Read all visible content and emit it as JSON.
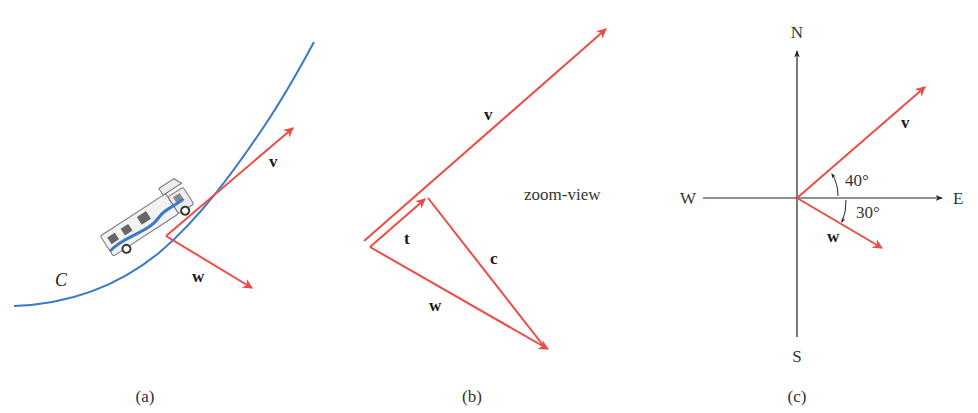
{
  "figure": {
    "colors": {
      "vector": "#ef4b45",
      "curve": "#3b78c9",
      "axis": "#222222",
      "text": "#222222"
    },
    "panel_a": {
      "caption": "(a)",
      "curve_label": "C",
      "vector_v_label": "v",
      "vector_w_label": "w",
      "vehicle": "motorhome-on-curve"
    },
    "panel_b": {
      "caption": "(b)",
      "title": "zoom-view",
      "vector_v_label": "v",
      "vector_t_label": "t",
      "vector_c_label": "c",
      "vector_w_label": "w"
    },
    "panel_c": {
      "caption": "(c)",
      "compass": {
        "north": "N",
        "south": "S",
        "east": "E",
        "west": "W"
      },
      "vector_v_label": "v",
      "vector_w_label": "w",
      "angle_v": "40°",
      "angle_w": "30°"
    }
  }
}
